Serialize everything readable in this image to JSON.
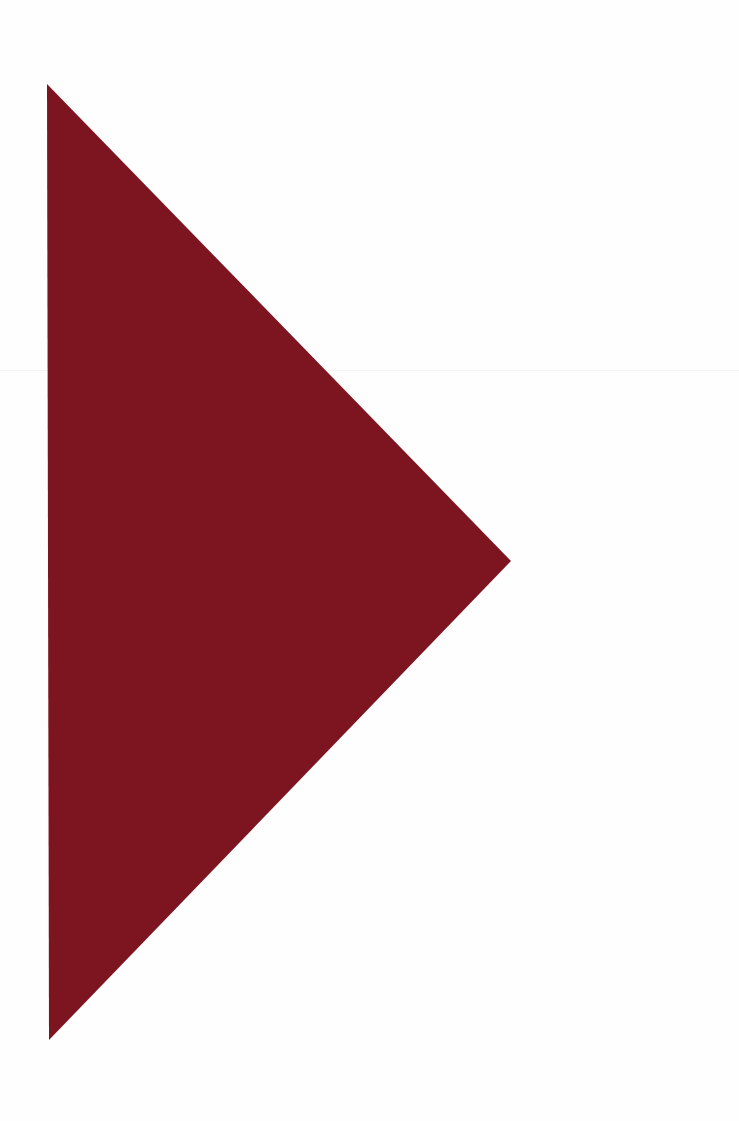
{
  "canvas": {
    "width": 739,
    "height": 1121,
    "background": "#fefefe"
  },
  "shape": {
    "type": "triangle",
    "direction": "right",
    "fill": "#7d1520",
    "points": "47,84 511,561 49,1040"
  }
}
